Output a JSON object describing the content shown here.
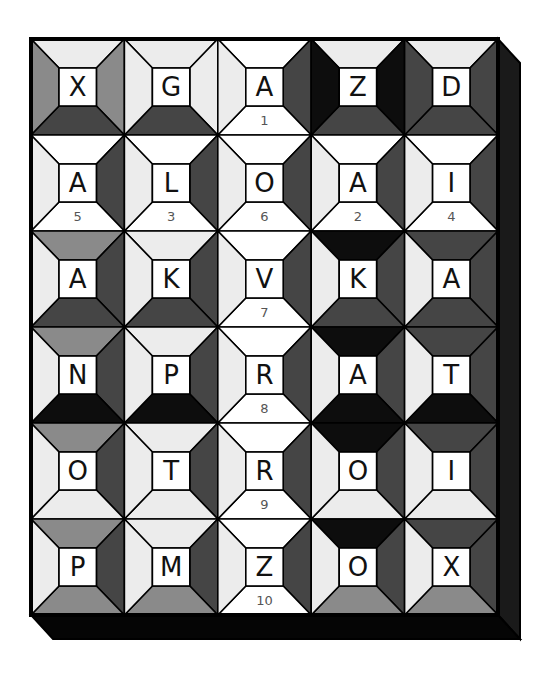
{
  "puzzle": {
    "rows": 6,
    "cols": 5,
    "shades": {
      "white": "#ffffff",
      "light": "#ececec",
      "medium": "#8a8a8a",
      "dark": "#454545",
      "black": "#0d0d0d"
    },
    "frame_color": "#000000",
    "shadow_color": "#1a1a1a",
    "cells": [
      [
        {
          "letter": "X",
          "number": "",
          "top": "light",
          "right": "medium",
          "bottom": "dark",
          "left": "medium"
        },
        {
          "letter": "G",
          "number": "",
          "top": "light",
          "right": "light",
          "bottom": "dark",
          "left": "light"
        },
        {
          "letter": "A",
          "number": "1",
          "top": "white",
          "right": "dark",
          "bottom": "white",
          "left": "light"
        },
        {
          "letter": "Z",
          "number": "",
          "top": "light",
          "right": "black",
          "bottom": "dark",
          "left": "black"
        },
        {
          "letter": "D",
          "number": "",
          "top": "light",
          "right": "dark",
          "bottom": "dark",
          "left": "dark"
        }
      ],
      [
        {
          "letter": "A",
          "number": "5",
          "top": "white",
          "right": "dark",
          "bottom": "white",
          "left": "light"
        },
        {
          "letter": "L",
          "number": "3",
          "top": "white",
          "right": "dark",
          "bottom": "white",
          "left": "light"
        },
        {
          "letter": "O",
          "number": "6",
          "top": "white",
          "right": "dark",
          "bottom": "white",
          "left": "light"
        },
        {
          "letter": "A",
          "number": "2",
          "top": "white",
          "right": "dark",
          "bottom": "white",
          "left": "light"
        },
        {
          "letter": "I",
          "number": "4",
          "top": "white",
          "right": "dark",
          "bottom": "white",
          "left": "light"
        }
      ],
      [
        {
          "letter": "A",
          "number": "",
          "top": "medium",
          "right": "dark",
          "bottom": "dark",
          "left": "light"
        },
        {
          "letter": "K",
          "number": "",
          "top": "light",
          "right": "dark",
          "bottom": "dark",
          "left": "light"
        },
        {
          "letter": "V",
          "number": "7",
          "top": "white",
          "right": "dark",
          "bottom": "white",
          "left": "light"
        },
        {
          "letter": "K",
          "number": "",
          "top": "black",
          "right": "dark",
          "bottom": "dark",
          "left": "light"
        },
        {
          "letter": "A",
          "number": "",
          "top": "dark",
          "right": "dark",
          "bottom": "dark",
          "left": "light"
        }
      ],
      [
        {
          "letter": "N",
          "number": "",
          "top": "medium",
          "right": "dark",
          "bottom": "black",
          "left": "light"
        },
        {
          "letter": "P",
          "number": "",
          "top": "light",
          "right": "dark",
          "bottom": "black",
          "left": "light"
        },
        {
          "letter": "R",
          "number": "8",
          "top": "white",
          "right": "dark",
          "bottom": "white",
          "left": "light"
        },
        {
          "letter": "A",
          "number": "",
          "top": "black",
          "right": "dark",
          "bottom": "black",
          "left": "light"
        },
        {
          "letter": "T",
          "number": "",
          "top": "dark",
          "right": "dark",
          "bottom": "black",
          "left": "light"
        }
      ],
      [
        {
          "letter": "O",
          "number": "",
          "top": "medium",
          "right": "dark",
          "bottom": "light",
          "left": "light"
        },
        {
          "letter": "T",
          "number": "",
          "top": "light",
          "right": "dark",
          "bottom": "light",
          "left": "light"
        },
        {
          "letter": "R",
          "number": "9",
          "top": "white",
          "right": "dark",
          "bottom": "white",
          "left": "light"
        },
        {
          "letter": "O",
          "number": "",
          "top": "black",
          "right": "dark",
          "bottom": "light",
          "left": "light"
        },
        {
          "letter": "I",
          "number": "",
          "top": "dark",
          "right": "dark",
          "bottom": "light",
          "left": "light"
        }
      ],
      [
        {
          "letter": "P",
          "number": "",
          "top": "medium",
          "right": "dark",
          "bottom": "medium",
          "left": "light"
        },
        {
          "letter": "M",
          "number": "",
          "top": "light",
          "right": "dark",
          "bottom": "medium",
          "left": "light"
        },
        {
          "letter": "Z",
          "number": "10",
          "top": "white",
          "right": "dark",
          "bottom": "white",
          "left": "light"
        },
        {
          "letter": "O",
          "number": "",
          "top": "black",
          "right": "dark",
          "bottom": "medium",
          "left": "light"
        },
        {
          "letter": "X",
          "number": "",
          "top": "dark",
          "right": "dark",
          "bottom": "medium",
          "left": "light"
        }
      ]
    ]
  }
}
